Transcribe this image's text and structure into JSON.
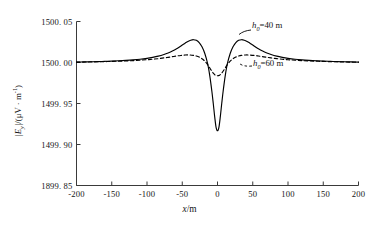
{
  "chart_data": {
    "type": "line",
    "title": "",
    "xlabel": "x/m",
    "ylabel": "|E_y|/(μV · m⁻¹)",
    "xlim": [
      -200,
      200
    ],
    "ylim": [
      1499.85,
      1500.05
    ],
    "grid": false,
    "legend_position": "inline-annotation",
    "xticks": [
      "-200",
      "-150",
      "-100",
      "-50",
      "0",
      "50",
      "100",
      "150",
      "200"
    ],
    "xtick_values": [
      -200,
      -150,
      -100,
      -50,
      0,
      50,
      100,
      150,
      200
    ],
    "yticks": [
      "1899. 85",
      "1499. 90",
      "1499. 95",
      "1500. 00",
      "1500. 05"
    ],
    "ytick_values": [
      1499.85,
      1499.9,
      1499.95,
      1500.0,
      1500.05
    ],
    "annotations": [
      {
        "id": "h40",
        "text_prefix": "h",
        "text_sub": "0",
        "text_suffix": "=40  m",
        "for_series": "h0 = 40 m"
      },
      {
        "id": "h60",
        "text_prefix": "h",
        "text_sub": "0",
        "text_suffix": "=60  m",
        "for_series": "h0 = 60 m"
      }
    ],
    "series": [
      {
        "name": "h0 = 40 m",
        "style": "solid",
        "color": "#000000",
        "x": [
          -200,
          -190,
          -180,
          -170,
          -160,
          -150,
          -140,
          -130,
          -120,
          -110,
          -100,
          -92,
          -84,
          -76,
          -70,
          -64,
          -58,
          -54,
          -50,
          -46,
          -42,
          -38,
          -34,
          -30,
          -26,
          -22,
          -18,
          -14,
          -11,
          -8,
          -6,
          -4,
          -2,
          0,
          2,
          4,
          6,
          8,
          11,
          14,
          18,
          22,
          26,
          30,
          34,
          38,
          42,
          46,
          50,
          54,
          58,
          64,
          70,
          76,
          84,
          92,
          100,
          110,
          120,
          130,
          140,
          150,
          160,
          170,
          180,
          190,
          200
        ],
        "y": [
          1500.0005,
          1500.0007,
          1500.0009,
          1500.0011,
          1500.0014,
          1500.0017,
          1500.0021,
          1500.0026,
          1500.0032,
          1500.004,
          1500.0051,
          1500.0063,
          1500.0078,
          1500.0098,
          1500.0117,
          1500.014,
          1500.0168,
          1500.019,
          1500.0213,
          1500.0236,
          1500.0257,
          1500.0272,
          1500.0278,
          1500.027,
          1500.0243,
          1500.0192,
          1500.011,
          1499.9985,
          1499.984,
          1499.965,
          1499.95,
          1499.934,
          1499.921,
          1499.9168,
          1499.921,
          1499.934,
          1499.95,
          1499.965,
          1499.984,
          1499.9985,
          1500.011,
          1500.0192,
          1500.0243,
          1500.027,
          1500.0278,
          1500.0272,
          1500.0257,
          1500.0236,
          1500.0213,
          1500.019,
          1500.0168,
          1500.014,
          1500.0117,
          1500.0098,
          1500.0078,
          1500.0063,
          1500.0051,
          1500.004,
          1500.0032,
          1500.0026,
          1500.0021,
          1500.0017,
          1500.0014,
          1500.0011,
          1500.0009,
          1500.0007,
          1500.0005
        ]
      },
      {
        "name": "h0 = 60 m",
        "style": "dashed",
        "color": "#000000",
        "x": [
          -200,
          -190,
          -180,
          -170,
          -160,
          -150,
          -140,
          -130,
          -120,
          -110,
          -100,
          -92,
          -84,
          -76,
          -70,
          -64,
          -58,
          -52,
          -46,
          -40,
          -34,
          -30,
          -26,
          -22,
          -18,
          -14,
          -10,
          -6,
          -3,
          0,
          3,
          6,
          10,
          14,
          18,
          22,
          26,
          30,
          34,
          40,
          46,
          52,
          58,
          64,
          70,
          76,
          84,
          92,
          100,
          110,
          120,
          130,
          140,
          150,
          160,
          170,
          180,
          190,
          200
        ],
        "y": [
          1500.0004,
          1500.0005,
          1500.0007,
          1500.0009,
          1500.0011,
          1500.0013,
          1500.0016,
          1500.0019,
          1500.0023,
          1500.0028,
          1500.0034,
          1500.004,
          1500.0047,
          1500.0056,
          1500.0063,
          1500.0071,
          1500.0079,
          1500.0086,
          1500.0091,
          1500.0092,
          1500.0087,
          1500.0079,
          1500.0066,
          1500.0046,
          1500.0016,
          1499.9975,
          1499.992,
          1499.987,
          1499.9845,
          1499.9838,
          1499.9845,
          1499.987,
          1499.992,
          1499.9975,
          1500.0016,
          1500.0046,
          1500.0066,
          1500.0079,
          1500.0087,
          1500.0092,
          1500.0091,
          1500.0086,
          1500.0079,
          1500.0071,
          1500.0063,
          1500.0056,
          1500.0047,
          1500.004,
          1500.0034,
          1500.0028,
          1500.0023,
          1500.0019,
          1500.0016,
          1500.0013,
          1500.0011,
          1500.0009,
          1500.0007,
          1500.0005,
          1500.0004
        ]
      }
    ]
  },
  "axis": {
    "y_title_main": "|E",
    "y_title_sub": "y",
    "y_title_rest": "|/(μV · m",
    "y_title_sup": "-1",
    "y_title_close": ")",
    "x_title_sym": "x",
    "x_title_unit": "/m"
  },
  "colors": {
    "axis": "#3a3a3a",
    "curve": "#000000",
    "text": "#141414",
    "background": "#ffffff"
  }
}
